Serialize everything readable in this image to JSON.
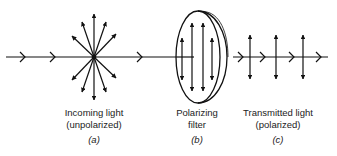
{
  "diagram": {
    "panels": [
      {
        "id": "a",
        "line1": "Incoming light",
        "line2": "(unpolarized)",
        "label": "(a)"
      },
      {
        "id": "b",
        "line1": "Polarizing",
        "line2": "filter",
        "label": "(b)"
      },
      {
        "id": "c",
        "line1": "Transmitted light",
        "line2": "(polarized)",
        "label": "(c)"
      }
    ],
    "colors": {
      "stroke": "#111111",
      "text": "#222222",
      "background": "#ffffff"
    }
  }
}
